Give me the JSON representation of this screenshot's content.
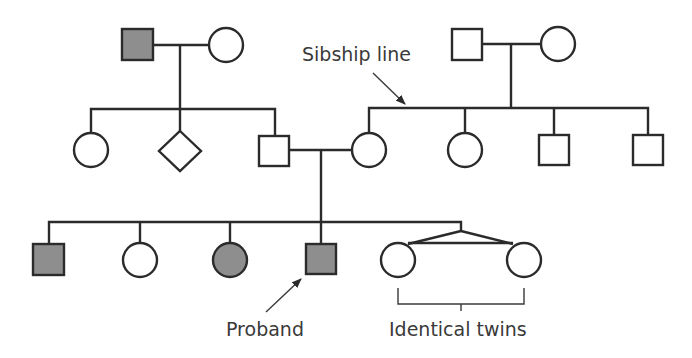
{
  "diagram": {
    "type": "pedigree chart",
    "labels": {
      "sibship_line": "Sibship line",
      "proband": "Proband",
      "identical_twins": "Identical twins"
    },
    "colors": {
      "line": "#2b2b2b",
      "affected_fill": "#8e8e8e",
      "unaffected_fill": "#ffffff"
    },
    "generations": [
      {
        "generation": "I",
        "couples": [
          {
            "members": [
              {
                "sex": "male",
                "affected": true
              },
              {
                "sex": "female",
                "affected": false
              }
            ]
          },
          {
            "members": [
              {
                "sex": "male",
                "affected": false
              },
              {
                "sex": "female",
                "affected": false
              }
            ]
          }
        ]
      },
      {
        "generation": "II",
        "sibships": [
          {
            "children": [
              {
                "sex": "female",
                "affected": false
              },
              {
                "sex": "unknown",
                "affected": false
              },
              {
                "sex": "male",
                "affected": false
              }
            ]
          },
          {
            "children": [
              {
                "sex": "female",
                "affected": false
              },
              {
                "sex": "female",
                "affected": false
              },
              {
                "sex": "male",
                "affected": false
              },
              {
                "sex": "male",
                "affected": false
              }
            ]
          }
        ]
      },
      {
        "generation": "III",
        "children": [
          {
            "sex": "male",
            "affected": true
          },
          {
            "sex": "female",
            "affected": false
          },
          {
            "sex": "female",
            "affected": true
          },
          {
            "sex": "male",
            "affected": true,
            "proband": true
          },
          {
            "sex": "female",
            "affected": false,
            "twin": "identical"
          },
          {
            "sex": "female",
            "affected": false,
            "twin": "identical"
          }
        ]
      }
    ]
  }
}
